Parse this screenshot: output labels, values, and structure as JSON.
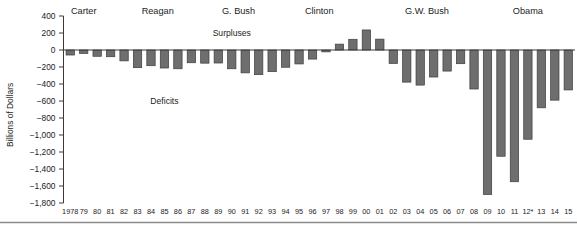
{
  "chart_data": {
    "type": "bar",
    "title": "",
    "subtitle": "",
    "xlabel": "",
    "ylabel": "Billions of Dollars",
    "ylim": [
      -1800,
      400
    ],
    "ytick_step": 200,
    "ytick_labels": [
      "400",
      "200",
      "0",
      "−200",
      "−400",
      "−600",
      "−800",
      "−1,000",
      "−1,200",
      "−1,400",
      "−1,600",
      "−1,800"
    ],
    "ytick_values": [
      400,
      200,
      0,
      -200,
      -400,
      -600,
      -800,
      -1000,
      -1200,
      -1400,
      -1600,
      -1800
    ],
    "grid": false,
    "legend": "none",
    "categories": [
      "1978",
      "79",
      "80",
      "81",
      "82",
      "83",
      "84",
      "85",
      "86",
      "87",
      "88",
      "89",
      "90",
      "91",
      "92",
      "93",
      "94",
      "95",
      "96",
      "97",
      "98",
      "99",
      "00",
      "01",
      "02",
      "03",
      "04",
      "05",
      "06",
      "07",
      "08",
      "09",
      "10",
      "11",
      "12*",
      "13",
      "14",
      "15"
    ],
    "values": [
      -59,
      -40,
      -74,
      -79,
      -128,
      -208,
      -185,
      -212,
      -221,
      -150,
      -155,
      -153,
      -221,
      -269,
      -290,
      -255,
      -203,
      -164,
      -107,
      -22,
      69,
      126,
      236,
      128,
      -158,
      -378,
      -413,
      -318,
      -248,
      -161,
      -459,
      -1700,
      -1250,
      -1550,
      -1050,
      -680,
      -590,
      -470
    ],
    "annotations": [
      {
        "text": "Surpluses",
        "x_category": "90",
        "y": 200
      },
      {
        "text": "Deficits",
        "x_category": "85",
        "y": -600
      }
    ],
    "president_labels": [
      {
        "text": "Carter",
        "start_category": "1978",
        "end_category": "80"
      },
      {
        "text": "Reagan",
        "start_category": "81",
        "end_category": "88"
      },
      {
        "text": "G. Bush",
        "start_category": "89",
        "end_category": "92"
      },
      {
        "text": "Clinton",
        "start_category": "93",
        "end_category": "00"
      },
      {
        "text": "G.W. Bush",
        "start_category": "01",
        "end_category": "08"
      },
      {
        "text": "Obama",
        "start_category": "09",
        "end_category": "15"
      }
    ],
    "bar_color": "#6e6e6e",
    "bar_edge_color": "#3d3d3d"
  }
}
